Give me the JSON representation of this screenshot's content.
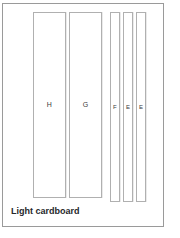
{
  "figure": {
    "caption": "Light cardboard",
    "material_color": "#ffffff",
    "outline_color": "#9a9a9a",
    "piece_outline_color": "#b0b0b0",
    "label_color": "#3a3a3a",
    "caption_color": "#26272b",
    "pieces": [
      {
        "label": "H",
        "kind": "wide-panel",
        "x": 30,
        "y": 8,
        "w": 33,
        "h": 186
      },
      {
        "label": "G",
        "kind": "wide-panel",
        "x": 66,
        "y": 8,
        "w": 33,
        "h": 186
      },
      {
        "label": "F",
        "kind": "narrow-strip",
        "x": 107,
        "y": 8,
        "w": 10,
        "h": 190
      },
      {
        "label": "E",
        "kind": "narrow-strip",
        "x": 120,
        "y": 8,
        "w": 10,
        "h": 190
      },
      {
        "label": "E",
        "kind": "narrow-strip",
        "x": 133,
        "y": 8,
        "w": 10,
        "h": 190
      }
    ]
  }
}
